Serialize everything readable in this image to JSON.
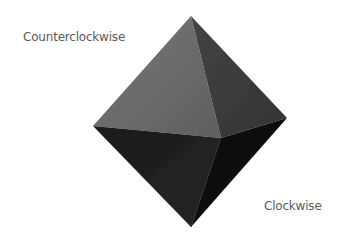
{
  "labels": {
    "counterclockwise": "Counterclockwise",
    "clockwise": "Clockwise"
  },
  "shape": {
    "name": "octahedron",
    "vertices": {
      "top": [
        191,
        16
      ],
      "left": [
        93,
        126
      ],
      "right": [
        287,
        118
      ],
      "bottom": [
        191,
        227
      ],
      "front": [
        221,
        138
      ]
    },
    "colors": {
      "upper_left_face": "#6a6a6a",
      "upper_right_face": "#3c3c3c",
      "lower_left_face": "#202020",
      "lower_right_face": "#0e0e0e"
    }
  }
}
